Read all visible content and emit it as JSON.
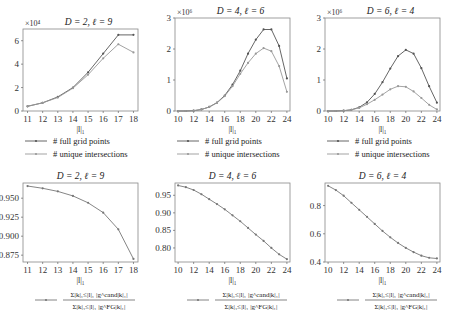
{
  "chart_data": [
    {
      "type": "line",
      "title": "D = 2, ℓ = 9",
      "xlabel": "|l|₁",
      "ylabel": "",
      "y_multiplier": "×10⁴",
      "x": [
        11,
        12,
        13,
        14,
        15,
        16,
        17,
        18
      ],
      "xticks": [
        11,
        12,
        13,
        14,
        15,
        16,
        17,
        18
      ],
      "yticks": [
        0,
        2,
        4,
        6
      ],
      "ylim": [
        0,
        7
      ],
      "xlim": [
        10.7,
        18.3
      ],
      "series": [
        {
          "name": "# full grid points",
          "color": "#555555",
          "values": [
            0.4,
            0.7,
            1.2,
            2.0,
            3.3,
            4.9,
            6.5,
            6.5
          ]
        },
        {
          "name": "# unique intersections",
          "color": "#999999",
          "values": [
            0.4,
            0.7,
            1.15,
            1.95,
            3.1,
            4.5,
            5.7,
            5.0
          ]
        }
      ],
      "legend_position": "below"
    },
    {
      "type": "line",
      "title": "D = 4, ℓ = 6",
      "xlabel": "|l|₁",
      "ylabel": "",
      "y_multiplier": "×10⁶",
      "x": [
        10,
        11,
        12,
        13,
        14,
        15,
        16,
        17,
        18,
        19,
        20,
        21,
        22,
        23,
        24
      ],
      "xticks": [
        10,
        12,
        14,
        16,
        18,
        20,
        22,
        24
      ],
      "yticks": [
        0,
        1,
        2,
        3
      ],
      "ylim": [
        0,
        3
      ],
      "xlim": [
        9.6,
        24.4
      ],
      "series": [
        {
          "name": "# full grid points",
          "color": "#555555",
          "values": [
            0,
            0,
            0.01,
            0.05,
            0.13,
            0.27,
            0.5,
            0.85,
            1.3,
            1.85,
            2.3,
            2.63,
            2.63,
            2.1,
            1.05
          ]
        },
        {
          "name": "# unique intersections",
          "color": "#999999",
          "values": [
            0,
            0,
            0.01,
            0.05,
            0.13,
            0.26,
            0.48,
            0.8,
            1.2,
            1.55,
            1.85,
            2.03,
            1.93,
            1.45,
            0.62
          ]
        }
      ],
      "legend_position": "below"
    },
    {
      "type": "line",
      "title": "D = 6, ℓ = 4",
      "xlabel": "|l|₁",
      "ylabel": "",
      "y_multiplier": "×10⁶",
      "x": [
        10,
        11,
        12,
        13,
        14,
        15,
        16,
        17,
        18,
        19,
        20,
        21,
        22,
        23,
        24
      ],
      "xticks": [
        10,
        12,
        14,
        16,
        18,
        20,
        22,
        24
      ],
      "yticks": [
        0,
        1,
        2,
        3
      ],
      "ylim": [
        0,
        3
      ],
      "xlim": [
        9.6,
        24.4
      ],
      "series": [
        {
          "name": "# full grid points",
          "color": "#555555",
          "values": [
            0,
            0,
            0.01,
            0.04,
            0.12,
            0.28,
            0.55,
            0.93,
            1.37,
            1.77,
            1.97,
            1.85,
            1.38,
            0.8,
            0.27
          ]
        },
        {
          "name": "# unique intersections",
          "color": "#999999",
          "values": [
            0,
            0,
            0.01,
            0.04,
            0.1,
            0.22,
            0.36,
            0.53,
            0.7,
            0.8,
            0.78,
            0.63,
            0.42,
            0.2,
            0.05
          ]
        }
      ],
      "legend_position": "below"
    },
    {
      "type": "line",
      "title": "D = 2, ℓ = 9",
      "xlabel": "|l|₁",
      "ylabel": "",
      "x": [
        11,
        12,
        13,
        14,
        15,
        16,
        17,
        18
      ],
      "xticks": [
        11,
        12,
        13,
        14,
        15,
        16,
        17,
        18
      ],
      "yticks": [
        0.875,
        0.9,
        0.925,
        0.95
      ],
      "ytick_labels": [
        "0.875",
        "0.900",
        "0.925",
        "0.950"
      ],
      "ylim": [
        0.866,
        0.97
      ],
      "xlim": [
        10.7,
        18.3
      ],
      "series": [
        {
          "name": "Σ_{|k|₁≤|l|₁} |g^{cand}_{|k|₁}| / Σ_{|k|₁≤|l|₁} |g^{FG}_{|k|₁}|",
          "color": "#777777",
          "values": [
            0.966,
            0.963,
            0.959,
            0.953,
            0.944,
            0.931,
            0.909,
            0.87
          ]
        }
      ],
      "legend_position": "below"
    },
    {
      "type": "line",
      "title": "D = 4, ℓ = 6",
      "xlabel": "|l|₁",
      "ylabel": "",
      "x": [
        10,
        11,
        12,
        13,
        14,
        15,
        16,
        17,
        18,
        19,
        20,
        21,
        22,
        23,
        24
      ],
      "xticks": [
        10,
        12,
        14,
        16,
        18,
        20,
        22,
        24
      ],
      "yticks": [
        0.8,
        0.85,
        0.9,
        0.95
      ],
      "ytick_labels": [
        "0.80",
        "0.85",
        "0.90",
        "0.95"
      ],
      "ylim": [
        0.76,
        0.985
      ],
      "xlim": [
        9.6,
        24.4
      ],
      "series": [
        {
          "name": "Σ_{|k|₁≤|l|₁} |g^{cand}_{|k|₁}| / Σ_{|k|₁≤|l|₁} |g^{FG}_{|k|₁}|",
          "color": "#777777",
          "values": [
            0.978,
            0.973,
            0.965,
            0.953,
            0.939,
            0.925,
            0.91,
            0.893,
            0.876,
            0.857,
            0.838,
            0.82,
            0.8,
            0.782,
            0.768
          ]
        }
      ],
      "legend_position": "below"
    },
    {
      "type": "line",
      "title": "D = 6, ℓ = 4",
      "xlabel": "|l|₁",
      "ylabel": "",
      "x": [
        10,
        11,
        12,
        13,
        14,
        15,
        16,
        17,
        18,
        19,
        20,
        21,
        22,
        23,
        24
      ],
      "xticks": [
        10,
        12,
        14,
        16,
        18,
        20,
        22,
        24
      ],
      "yticks": [
        0.4,
        0.6,
        0.8
      ],
      "ytick_labels": [
        "0.4",
        "0.6",
        "0.8"
      ],
      "ylim": [
        0.4,
        0.96
      ],
      "xlim": [
        9.6,
        24.4
      ],
      "series": [
        {
          "name": "Σ_{|k|₁≤|l|₁} |g^{cand}_{|k|₁}| / Σ_{|k|₁≤|l|₁} |g^{FG}_{|k|₁}|",
          "color": "#777777",
          "values": [
            0.94,
            0.91,
            0.87,
            0.82,
            0.77,
            0.72,
            0.67,
            0.62,
            0.575,
            0.535,
            0.5,
            0.47,
            0.445,
            0.43,
            0.425
          ]
        }
      ],
      "legend_position": "below"
    }
  ],
  "legend_labels": {
    "full": "# full grid points",
    "unique": "# unique intersections",
    "ratio_num": "Σ|k|₁≤|l|₁ |g^cand|k|₁|",
    "ratio_den": "Σ|k|₁≤|l|₁ |g^FG|k|₁|"
  }
}
